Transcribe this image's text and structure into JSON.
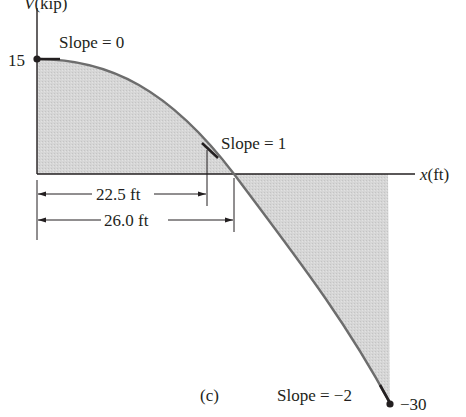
{
  "figure": {
    "caption": "(c)",
    "y_axis_label": "V(kip)",
    "x_axis_label": "x(ft)",
    "fill_color": "#d3d3d3",
    "curve_color": "#6d6d6d",
    "ink_color": "#231f20"
  },
  "annotations": {
    "y_max_value": "15",
    "y_min_value": "−30",
    "slope_start": "Slope = 0",
    "slope_mid": "Slope = 1",
    "slope_end": "Slope = −2",
    "dim_short": "22.5 ft",
    "dim_long": "26.0 ft"
  },
  "chart_data": {
    "type": "area",
    "xlabel": "x(ft)",
    "ylabel": "V(kip)",
    "points": [
      {
        "x": 0,
        "V": 15,
        "slope": 0
      },
      {
        "x": 22.5,
        "V": 2.3,
        "slope": 1
      },
      {
        "x": 26.0,
        "V": 0
      },
      {
        "x": 36,
        "V": -30,
        "slope": -2
      }
    ],
    "dimensions": [
      {
        "label": "22.5 ft",
        "from": 0,
        "to": 22.5
      },
      {
        "label": "26.0 ft",
        "from": 0,
        "to": 26.0
      }
    ]
  }
}
